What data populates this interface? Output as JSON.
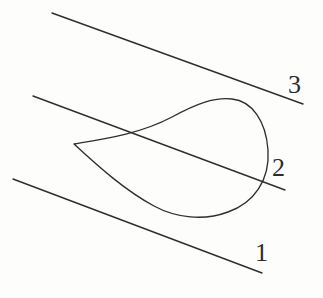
{
  "figure": {
    "background_color": "#fdfdfc",
    "stroke_color": "#2e2e30",
    "label_color": "#2b2b2e",
    "labels": [
      {
        "id": "line-1-label",
        "text": "1",
        "x": 255,
        "y": 240
      },
      {
        "id": "line-2-label",
        "text": "2",
        "x": 272,
        "y": 155
      },
      {
        "id": "line-3-label",
        "text": "3",
        "x": 288,
        "y": 72
      }
    ],
    "lines": [
      {
        "name": "line-1",
        "label": "1",
        "x1": 13,
        "y1": 179,
        "x2": 262,
        "y2": 273
      },
      {
        "name": "line-2",
        "label": "2",
        "x1": 33,
        "y1": 96,
        "x2": 285,
        "y2": 190
      },
      {
        "name": "line-3",
        "label": "3",
        "x1": 52,
        "y1": 13,
        "x2": 303,
        "y2": 104
      }
    ],
    "curve": {
      "name": "cusp-loop-curve",
      "description": "teardrop loop with a cusp at the left",
      "cusp_point": {
        "x": 74,
        "y": 144
      },
      "top_point": {
        "x": 215,
        "y": 98
      },
      "right_point": {
        "x": 268,
        "y": 155
      },
      "bottom_point": {
        "x": 196,
        "y": 216
      },
      "path": "M 74 144 C 104 139, 140 134, 172 117 C 196 104, 214 97, 232 99 C 252 101, 266 121, 268 150 C 270 180, 254 203, 228 212 C 204 221, 176 218, 154 206 C 126 191, 100 168, 74 144 Z"
    }
  }
}
